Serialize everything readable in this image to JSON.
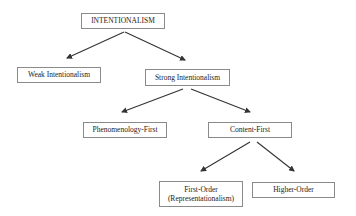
{
  "diagram": {
    "type": "tree",
    "nodes": {
      "root": {
        "label": "INTENTIONALISM"
      },
      "weak": {
        "label": "Weak Intentionalism"
      },
      "strong": {
        "label": "Strong Intentionalism"
      },
      "phenomenology_first": {
        "label": "Phenomenology-First"
      },
      "content_first": {
        "label": "Content-First"
      },
      "first_order": {
        "line1": "First-Order",
        "line2": "(Representationalism)"
      },
      "higher_order": {
        "label": "Higher-Order"
      }
    },
    "edges": [
      {
        "from": "root",
        "to": "weak"
      },
      {
        "from": "root",
        "to": "strong"
      },
      {
        "from": "strong",
        "to": "phenomenology_first"
      },
      {
        "from": "strong",
        "to": "content_first"
      },
      {
        "from": "content_first",
        "to": "first_order"
      },
      {
        "from": "content_first",
        "to": "higher_order"
      }
    ],
    "colors": {
      "line": "#333333",
      "border": "#8a8a8a",
      "text": "#222222"
    }
  }
}
